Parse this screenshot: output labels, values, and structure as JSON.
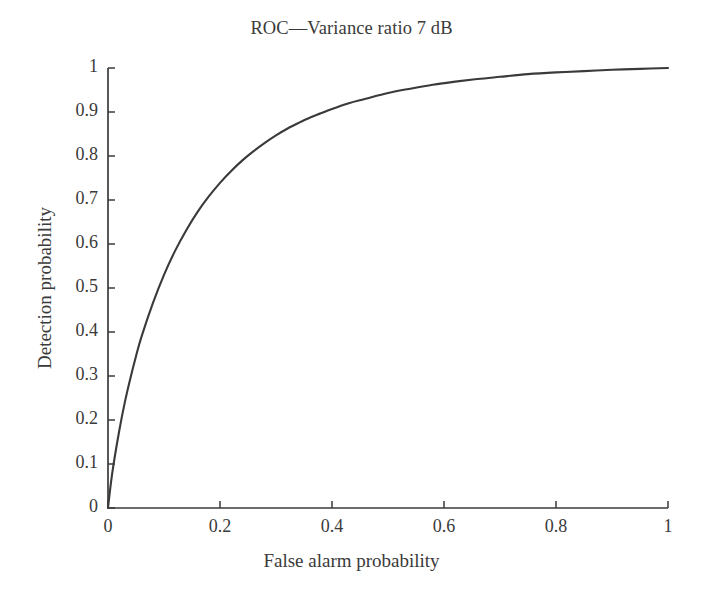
{
  "chart_data": {
    "type": "line",
    "title": "ROC—Variance ratio 7 dB",
    "xlabel": "False alarm probability",
    "ylabel": "Detection probability",
    "xlim": [
      0,
      1
    ],
    "ylim": [
      0,
      1
    ],
    "grid": false,
    "legend": null,
    "line_color": "#3a3a3a",
    "xticks": [
      0,
      0.2,
      0.4,
      0.6,
      0.8,
      1
    ],
    "xtick_labels": [
      "0",
      "0.2",
      "0.4",
      "0.6",
      "0.8",
      "1"
    ],
    "yticks": [
      0,
      0.1,
      0.2,
      0.3,
      0.4,
      0.5,
      0.6,
      0.7,
      0.8,
      0.9,
      1
    ],
    "ytick_labels": [
      "0",
      "0.1",
      "0.2",
      "0.3",
      "0.4",
      "0.5",
      "0.6",
      "0.7",
      "0.8",
      "0.9",
      "1"
    ],
    "series": [
      {
        "name": "ROC 7 dB",
        "x": [
          0,
          0.005,
          0.01,
          0.02,
          0.03,
          0.04,
          0.05,
          0.06,
          0.08,
          0.1,
          0.12,
          0.14,
          0.16,
          0.18,
          0.2,
          0.22,
          0.24,
          0.26,
          0.28,
          0.3,
          0.32,
          0.34,
          0.36,
          0.38,
          0.4,
          0.43,
          0.46,
          0.5,
          0.54,
          0.58,
          0.62,
          0.66,
          0.7,
          0.75,
          0.8,
          0.85,
          0.9,
          0.95,
          1
        ],
        "y": [
          0,
          0.055,
          0.1,
          0.175,
          0.24,
          0.295,
          0.345,
          0.39,
          0.465,
          0.53,
          0.585,
          0.632,
          0.673,
          0.708,
          0.739,
          0.766,
          0.79,
          0.811,
          0.83,
          0.847,
          0.862,
          0.875,
          0.887,
          0.897,
          0.907,
          0.92,
          0.93,
          0.943,
          0.953,
          0.962,
          0.969,
          0.975,
          0.98,
          0.986,
          0.99,
          0.993,
          0.996,
          0.998,
          1
        ]
      }
    ]
  }
}
